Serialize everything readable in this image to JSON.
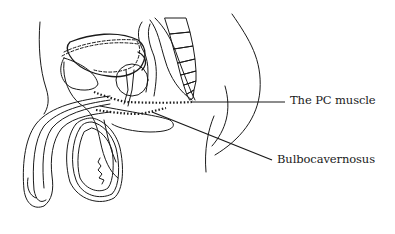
{
  "diagram": {
    "type": "anatomical-cross-section",
    "labels": {
      "pc_muscle": "The PC muscle",
      "bulbocavernosus": "Bulbocavernosus"
    },
    "colors": {
      "ink": "#1a1a1a",
      "background": "#ffffff"
    }
  }
}
